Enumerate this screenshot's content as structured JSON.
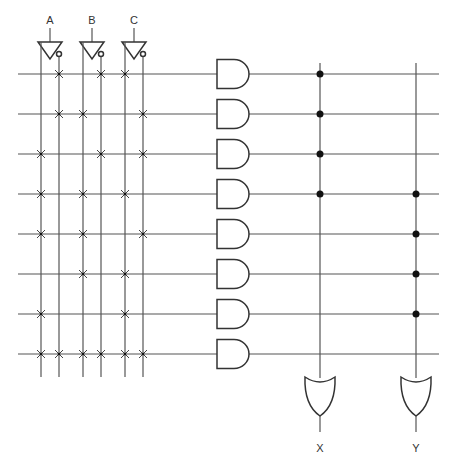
{
  "diagram": {
    "type": "PLA (programmable logic array)",
    "inputs": [
      {
        "name": "A",
        "x": 50
      },
      {
        "name": "B",
        "x": 92
      },
      {
        "name": "C",
        "x": 134
      }
    ],
    "input_lines": [
      {
        "id": "A",
        "x": 41
      },
      {
        "id": "A'",
        "x": 59
      },
      {
        "id": "B",
        "x": 83
      },
      {
        "id": "B'",
        "x": 101
      },
      {
        "id": "C",
        "x": 125
      },
      {
        "id": "C'",
        "x": 143
      }
    ],
    "rows_y": [
      74,
      114,
      154,
      194,
      234,
      274,
      314,
      354
    ],
    "and_plane": [
      [
        "A'",
        "B'",
        "C"
      ],
      [
        "A'",
        "B",
        "C'"
      ],
      [
        "A",
        "B'",
        "C'"
      ],
      [
        "A",
        "B",
        "C"
      ],
      [
        "A",
        "B",
        "C'"
      ],
      [
        "B",
        "C"
      ],
      [
        "A",
        "C"
      ],
      [
        "A",
        "A'",
        "B",
        "B'",
        "C",
        "C'"
      ]
    ],
    "outputs": [
      {
        "name": "X",
        "x": 320,
        "rows": [
          0,
          1,
          2,
          3
        ]
      },
      {
        "name": "Y",
        "x": 416,
        "rows": [
          3,
          4,
          5,
          6
        ]
      }
    ],
    "colors": {
      "line": "#555555",
      "gate": "#333333",
      "dot": "#111111",
      "background": "#ffffff"
    }
  }
}
